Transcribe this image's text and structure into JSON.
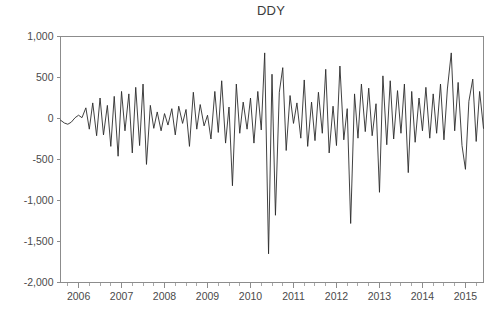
{
  "chart_data": {
    "type": "line",
    "title": "DDY",
    "xlabel": "",
    "ylabel": "",
    "ylim": [
      -2000,
      1000
    ],
    "xlim": [
      2005.58,
      2015.42
    ],
    "grid": false,
    "legend": null,
    "y_ticks": [
      1000,
      500,
      0,
      -500,
      -1000,
      -1500,
      -2000
    ],
    "y_tick_labels": [
      "1,000",
      "500",
      "0",
      "-500",
      "-1,000",
      "-1,500",
      "-2,000"
    ],
    "x_ticks": [
      2006,
      2007,
      2008,
      2009,
      2010,
      2011,
      2012,
      2013,
      2014,
      2015
    ],
    "x_tick_labels": [
      "2006",
      "2007",
      "2008",
      "2009",
      "2010",
      "2011",
      "2012",
      "2013",
      "2014",
      "2015"
    ],
    "x_minor_ticks_per_interval": 4,
    "series": [
      {
        "name": "DDY",
        "color": "#2b2b2b",
        "x": [
          2005.58,
          2005.67,
          2005.75,
          2005.83,
          2005.92,
          2006.0,
          2006.08,
          2006.17,
          2006.25,
          2006.33,
          2006.42,
          2006.5,
          2006.58,
          2006.67,
          2006.75,
          2006.83,
          2006.92,
          2007.0,
          2007.08,
          2007.17,
          2007.25,
          2007.33,
          2007.42,
          2007.5,
          2007.58,
          2007.67,
          2007.75,
          2007.83,
          2007.92,
          2008.0,
          2008.08,
          2008.17,
          2008.25,
          2008.33,
          2008.42,
          2008.5,
          2008.58,
          2008.67,
          2008.75,
          2008.83,
          2008.92,
          2009.0,
          2009.08,
          2009.17,
          2009.25,
          2009.33,
          2009.42,
          2009.5,
          2009.58,
          2009.67,
          2009.75,
          2009.83,
          2009.92,
          2010.0,
          2010.08,
          2010.17,
          2010.25,
          2010.33,
          2010.42,
          2010.5,
          2010.58,
          2010.67,
          2010.75,
          2010.83,
          2010.92,
          2011.0,
          2011.08,
          2011.17,
          2011.25,
          2011.33,
          2011.42,
          2011.5,
          2011.58,
          2011.67,
          2011.75,
          2011.83,
          2011.92,
          2012.0,
          2012.08,
          2012.17,
          2012.25,
          2012.33,
          2012.42,
          2012.5,
          2012.58,
          2012.67,
          2012.75,
          2012.83,
          2012.92,
          2013.0,
          2013.08,
          2013.17,
          2013.25,
          2013.33,
          2013.42,
          2013.5,
          2013.58,
          2013.67,
          2013.75,
          2013.83,
          2013.92,
          2014.0,
          2014.08,
          2014.17,
          2014.25,
          2014.33,
          2014.42,
          2014.5,
          2014.58,
          2014.67,
          2014.75,
          2014.83,
          2014.92,
          2015.0,
          2015.08,
          2015.17,
          2015.25,
          2015.33,
          2015.42
        ],
        "values": [
          -20,
          -55,
          -70,
          -45,
          10,
          40,
          10,
          130,
          -130,
          190,
          -210,
          250,
          -200,
          160,
          -340,
          270,
          -460,
          330,
          -150,
          300,
          -420,
          380,
          -330,
          420,
          -560,
          160,
          -120,
          80,
          -150,
          60,
          -80,
          120,
          -200,
          150,
          -60,
          110,
          -340,
          320,
          -130,
          170,
          -90,
          40,
          -250,
          330,
          -170,
          460,
          -300,
          140,
          -820,
          420,
          -180,
          200,
          -130,
          250,
          -300,
          330,
          -140,
          800,
          -1650,
          540,
          -1180,
          320,
          620,
          -390,
          280,
          -60,
          190,
          -240,
          470,
          -340,
          200,
          -270,
          320,
          -180,
          600,
          -420,
          150,
          -330,
          640,
          -260,
          120,
          -1280,
          300,
          -240,
          420,
          -160,
          370,
          -210,
          180,
          -900,
          520,
          -320,
          460,
          -250,
          340,
          -180,
          420,
          -660,
          330,
          -290,
          250,
          -150,
          380,
          -240,
          300,
          -180,
          420,
          -260,
          360,
          800,
          -150,
          440,
          -330,
          -620,
          210,
          480,
          -280,
          330,
          -120
        ]
      }
    ]
  },
  "figure": {
    "background_color": "#ffffff",
    "axis_color": "#8c8c8c",
    "text_color": "#4a4a4a",
    "line_color": "#2b2b2b"
  }
}
